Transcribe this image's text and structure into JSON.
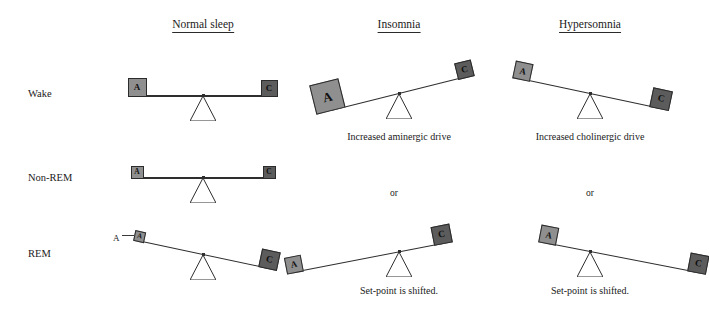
{
  "figure": {
    "title_columns": [
      {
        "id": "normal",
        "label": "Normal sleep",
        "cx": 203,
        "y": 18
      },
      {
        "id": "insomnia",
        "label": "Insomnia",
        "cx": 399,
        "y": 18
      },
      {
        "id": "hypersomnia",
        "label": "Hypersomnia",
        "cx": 590,
        "y": 18
      }
    ],
    "row_labels": [
      {
        "id": "wake",
        "label": "Wake",
        "x": 28,
        "y": 88
      },
      {
        "id": "non-rem",
        "label": "Non-REM",
        "x": 28,
        "y": 172
      },
      {
        "id": "rem",
        "label": "REM",
        "x": 28,
        "y": 248
      }
    ],
    "weights": {
      "aminergic_symbol": "A",
      "cholinergic_symbol": "C",
      "aminergic_color": "#8f8f8f",
      "cholinergic_color": "#5c5c5c"
    },
    "captions": [
      {
        "id": "insomnia-wake-caption",
        "text": "Increased aminergic drive",
        "cx": 399,
        "y": 131
      },
      {
        "id": "hypersomnia-wake-caption",
        "text": "Increased cholinergic drive",
        "cx": 590,
        "y": 131
      },
      {
        "id": "insomnia-or",
        "text": "or",
        "cx": 394,
        "y": 188
      },
      {
        "id": "hypersomnia-or",
        "text": "or",
        "cx": 590,
        "y": 188
      },
      {
        "id": "insomnia-shift-caption",
        "text": "Set-point is shifted.",
        "cx": 399,
        "y": 285
      },
      {
        "id": "hypersomnia-shift-caption",
        "text": "Set-point is shifted.",
        "cx": 590,
        "y": 285
      }
    ],
    "external_labels": [
      {
        "id": "rem-normal-a-label",
        "text": "A",
        "x": 113,
        "y": 233
      }
    ],
    "scales": [
      {
        "id": "normal-wake",
        "column": "normal",
        "row": "wake",
        "pivot_x": 203,
        "pivot_y": 96,
        "beam_length": 132,
        "tilt_deg": 0,
        "a_size": 19,
        "c_size": 17,
        "a_font": 9,
        "c_font": 9,
        "fulcrum_w": 26,
        "fulcrum_h": 25,
        "pivot_offset": 0
      },
      {
        "id": "normal-nonrem",
        "column": "normal",
        "row": "non-rem",
        "pivot_x": 203,
        "pivot_y": 178,
        "beam_length": 132,
        "tilt_deg": 0,
        "a_size": 13,
        "c_size": 13,
        "a_font": 7.5,
        "c_font": 7.5,
        "fulcrum_w": 26,
        "fulcrum_h": 25,
        "pivot_offset": 0
      },
      {
        "id": "normal-rem",
        "column": "normal",
        "row": "rem",
        "pivot_x": 203,
        "pivot_y": 255,
        "beam_length": 132,
        "tilt_deg": 12,
        "a_size": 11,
        "c_size": 19,
        "a_font": 7,
        "c_font": 9.5,
        "fulcrum_w": 26,
        "fulcrum_h": 25,
        "pivot_offset": 0
      },
      {
        "id": "insomnia-wake",
        "column": "insomnia",
        "row": "wake",
        "pivot_x": 399,
        "pivot_y": 94,
        "beam_length": 140,
        "tilt_deg": -14,
        "a_size": 30,
        "c_size": 17,
        "a_font": 13,
        "c_font": 9,
        "fulcrum_w": 26,
        "fulcrum_h": 25,
        "pivot_offset": 0
      },
      {
        "id": "insomnia-rem",
        "column": "insomnia",
        "row": "rem",
        "pivot_x": 399,
        "pivot_y": 252,
        "beam_length": 150,
        "tilt_deg": -11,
        "a_size": 17,
        "c_size": 19,
        "a_font": 9,
        "c_font": 9.5,
        "fulcrum_w": 26,
        "fulcrum_h": 25,
        "pivot_offset": 30
      },
      {
        "id": "hypersomnia-wake",
        "column": "hypersomnia",
        "row": "wake",
        "pivot_x": 590,
        "pivot_y": 94,
        "beam_length": 142,
        "tilt_deg": 12,
        "a_size": 18,
        "c_size": 20,
        "a_font": 9,
        "c_font": 9.5,
        "fulcrum_w": 26,
        "fulcrum_h": 25,
        "pivot_offset": 0
      },
      {
        "id": "hypersomnia-rem",
        "column": "hypersomnia",
        "row": "rem",
        "pivot_x": 590,
        "pivot_y": 252,
        "beam_length": 152,
        "tilt_deg": 11,
        "a_size": 18,
        "c_size": 19,
        "a_font": 9,
        "c_font": 9.5,
        "fulcrum_w": 26,
        "fulcrum_h": 25,
        "pivot_offset": -32
      }
    ]
  }
}
